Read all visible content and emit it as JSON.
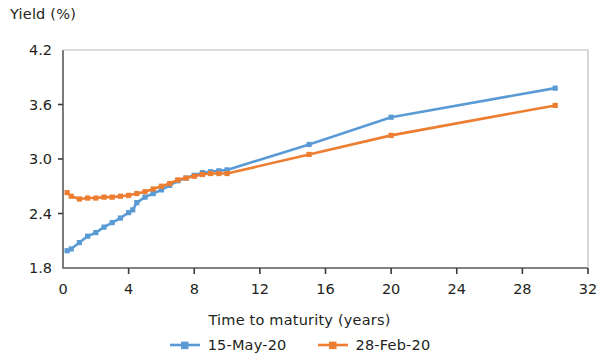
{
  "chart_data": {
    "type": "line",
    "title": "",
    "ylabel": "Yield (%)",
    "xlabel": "Time to maturity (years)",
    "xlim": [
      0,
      32
    ],
    "ylim": [
      1.8,
      4.2
    ],
    "xticks": [
      0,
      4,
      8,
      12,
      16,
      20,
      24,
      28,
      32
    ],
    "yticks": [
      1.8,
      2.4,
      3.0,
      3.6,
      4.2
    ],
    "xtick_labels": [
      "0",
      "4",
      "8",
      "12",
      "16",
      "20",
      "24",
      "28",
      "32"
    ],
    "ytick_labels": [
      "1.8",
      "2.4",
      "3.0",
      "3.6",
      "4.2"
    ],
    "grid": false,
    "legend_position": "bottom-center",
    "marker": "square",
    "series": [
      {
        "name": "15-May-20",
        "color": "#5b9bd5",
        "x": [
          0.25,
          0.5,
          1,
          1.5,
          2,
          2.5,
          3,
          3.5,
          4,
          4.25,
          4.5,
          5,
          5.5,
          6,
          6.5,
          7,
          7.5,
          8,
          8.5,
          9,
          9.5,
          10,
          15,
          20,
          30
        ],
        "y": [
          1.99,
          2.01,
          2.08,
          2.15,
          2.19,
          2.25,
          2.3,
          2.35,
          2.41,
          2.44,
          2.52,
          2.58,
          2.62,
          2.66,
          2.71,
          2.76,
          2.79,
          2.82,
          2.85,
          2.86,
          2.87,
          2.88,
          3.16,
          3.46,
          3.78
        ]
      },
      {
        "name": "28-Feb-20",
        "color": "#ed7d31",
        "x": [
          0.25,
          0.5,
          1,
          1.5,
          2,
          2.5,
          3,
          3.5,
          4,
          4.5,
          5,
          5.5,
          6,
          6.5,
          7,
          7.5,
          8,
          8.5,
          9,
          9.5,
          10,
          15,
          20,
          30
        ],
        "y": [
          2.63,
          2.59,
          2.56,
          2.57,
          2.57,
          2.58,
          2.58,
          2.59,
          2.6,
          2.62,
          2.64,
          2.67,
          2.7,
          2.73,
          2.77,
          2.79,
          2.81,
          2.83,
          2.84,
          2.84,
          2.84,
          3.05,
          3.26,
          3.59
        ]
      }
    ]
  },
  "legend": {
    "items": [
      {
        "label": "15-May-20",
        "color": "#5b9bd5"
      },
      {
        "label": "28-Feb-20",
        "color": "#ed7d31"
      }
    ]
  }
}
